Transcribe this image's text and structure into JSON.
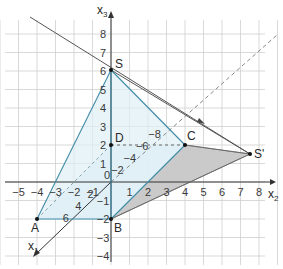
{
  "diagram": {
    "type": "3d-coordinate-sketch",
    "axes": {
      "x1": {
        "label": "x",
        "sub": "1",
        "ticks": [
          "2",
          "4",
          "6"
        ]
      },
      "x2": {
        "label": "x",
        "sub": "2",
        "ticks": [
          "-5",
          "-4",
          "-3",
          "-2",
          "-1",
          "0",
          "1",
          "2",
          "3",
          "4",
          "5",
          "6",
          "7",
          "8"
        ]
      },
      "x3": {
        "label": "x",
        "sub": "3",
        "ticks": [
          "8",
          "7",
          "6",
          "5",
          "4",
          "3",
          "2",
          "1",
          "-1",
          "-2",
          "-3",
          "-4"
        ]
      }
    },
    "diagonal_ticks": [
      "-2",
      "-4",
      "-6",
      "-8"
    ],
    "points": [
      {
        "name": "S",
        "label": "S"
      },
      {
        "name": "D",
        "label": "D"
      },
      {
        "name": "C",
        "label": "C"
      },
      {
        "name": "A",
        "label": "A"
      },
      {
        "name": "B",
        "label": "B"
      },
      {
        "name": "S'",
        "label": "S'"
      }
    ],
    "colors": {
      "pyramid_fill": "#dff0f7",
      "pyramid_edge": "#3f8ba6",
      "shadow_fill": "#c8c8c8",
      "grid": "#c9c9c9",
      "axis": "#333333",
      "light_ray": "#555555"
    }
  }
}
